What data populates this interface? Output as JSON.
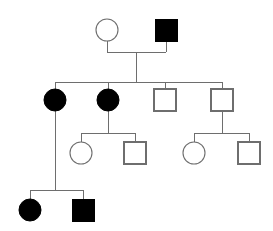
{
  "chart_data": {
    "type": "diagram",
    "title": "",
    "diagram_kind": "pedigree-chart",
    "canvas": {
      "width": 273,
      "height": 231,
      "background": "#ffffff"
    },
    "legend": {
      "circle": "female",
      "square": "male",
      "filled": "affected",
      "unfilled": "unaffected"
    },
    "colors": {
      "line": "#6e6e6e",
      "affected_fill": "#000000",
      "unaffected_fill": "#ffffff",
      "symbol_stroke": "#6e6e6e"
    },
    "style": {
      "circle_radius": 11,
      "square_size": 22,
      "line_width": 1
    },
    "generations": [
      {
        "id": "I",
        "label": "I",
        "y": 30,
        "individuals": [
          {
            "id": "I-1",
            "sex": "female",
            "shape": "circle",
            "affected": false,
            "x": 107,
            "y": 30
          },
          {
            "id": "I-2",
            "sex": "male",
            "shape": "square",
            "affected": true,
            "x": 166,
            "y": 30
          }
        ]
      },
      {
        "id": "II",
        "label": "II",
        "y": 100,
        "individuals": [
          {
            "id": "II-1",
            "sex": "female",
            "shape": "circle",
            "affected": true,
            "x": 55,
            "y": 100
          },
          {
            "id": "II-2",
            "sex": "female",
            "shape": "circle",
            "affected": true,
            "x": 108,
            "y": 100
          },
          {
            "id": "II-3",
            "sex": "male",
            "shape": "square",
            "affected": false,
            "x": 165,
            "y": 100
          },
          {
            "id": "II-4",
            "sex": "male",
            "shape": "square",
            "affected": false,
            "x": 222,
            "y": 100
          }
        ]
      },
      {
        "id": "III",
        "label": "III",
        "y": 153,
        "individuals": [
          {
            "id": "III-1",
            "sex": "female",
            "shape": "circle",
            "affected": false,
            "x": 81,
            "y": 153
          },
          {
            "id": "III-2",
            "sex": "male",
            "shape": "square",
            "affected": false,
            "x": 135,
            "y": 153
          },
          {
            "id": "III-3",
            "sex": "female",
            "shape": "circle",
            "affected": false,
            "x": 194,
            "y": 153
          },
          {
            "id": "III-4",
            "sex": "male",
            "shape": "square",
            "affected": false,
            "x": 249,
            "y": 153
          }
        ]
      },
      {
        "id": "IV",
        "label": "IV",
        "y": 210,
        "individuals": [
          {
            "id": "IV-1",
            "sex": "female",
            "shape": "circle",
            "affected": true,
            "x": 30,
            "y": 210
          },
          {
            "id": "IV-2",
            "sex": "male",
            "shape": "square",
            "affected": true,
            "x": 83,
            "y": 210
          }
        ]
      }
    ],
    "connectors": {
      "mating_lines": [
        {
          "id": "mating-I",
          "x1": 107,
          "x2": 166,
          "y": 52,
          "partners": [
            "I-1",
            "I-2"
          ]
        }
      ],
      "descent_lines": [
        {
          "id": "descent-I-to-II",
          "x": 136,
          "y1": 52,
          "y2": 82
        },
        {
          "id": "descent-II-2-to-III",
          "x": 108,
          "y1": 100,
          "y2": 133
        },
        {
          "id": "descent-II-4-to-III",
          "x": 222,
          "y1": 100,
          "y2": 133
        },
        {
          "id": "descent-II-1-to-IV",
          "x": 55,
          "y1": 100,
          "y2": 190
        }
      ],
      "sibship_lines": [
        {
          "id": "sibship-II",
          "x1": 55,
          "x2": 222,
          "y": 82,
          "children": [
            "II-1",
            "II-2",
            "II-3",
            "II-4"
          ]
        },
        {
          "id": "sibship-III-left",
          "x1": 81,
          "x2": 135,
          "y": 133,
          "children": [
            "III-1",
            "III-2"
          ]
        },
        {
          "id": "sibship-III-right",
          "x1": 194,
          "x2": 249,
          "y": 133,
          "children": [
            "III-3",
            "III-4"
          ]
        },
        {
          "id": "sibship-IV",
          "x1": 30,
          "x2": 83,
          "y": 190,
          "children": [
            "IV-1",
            "IV-2"
          ]
        }
      ],
      "drop_lines": [
        {
          "id": "drop-I-1",
          "x": 107,
          "y1": 41,
          "y2": 52
        },
        {
          "id": "drop-I-2",
          "x": 166,
          "y1": 41,
          "y2": 52
        },
        {
          "id": "drop-II-1",
          "x": 55,
          "y1": 82,
          "y2": 100
        },
        {
          "id": "drop-II-2",
          "x": 108,
          "y1": 82,
          "y2": 100
        },
        {
          "id": "drop-II-3",
          "x": 165,
          "y1": 82,
          "y2": 89
        },
        {
          "id": "drop-II-4",
          "x": 222,
          "y1": 82,
          "y2": 89
        },
        {
          "id": "drop-III-1",
          "x": 81,
          "y1": 133,
          "y2": 142
        },
        {
          "id": "drop-III-2",
          "x": 135,
          "y1": 133,
          "y2": 142
        },
        {
          "id": "drop-III-3",
          "x": 194,
          "y1": 133,
          "y2": 142
        },
        {
          "id": "drop-III-4",
          "x": 249,
          "y1": 133,
          "y2": 142
        },
        {
          "id": "drop-IV-1",
          "x": 30,
          "y1": 190,
          "y2": 199
        },
        {
          "id": "drop-IV-2",
          "x": 83,
          "y1": 190,
          "y2": 199
        }
      ]
    }
  }
}
